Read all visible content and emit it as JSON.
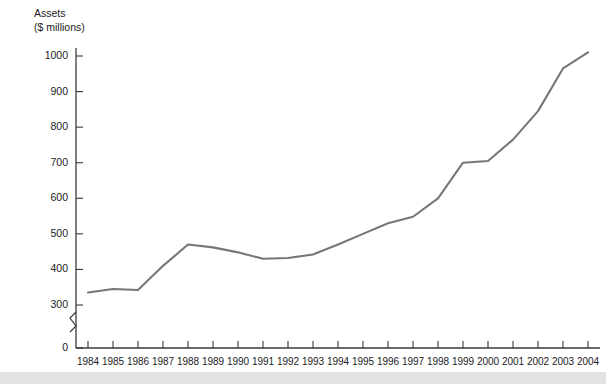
{
  "chart_data": {
    "type": "line",
    "title": "Assets",
    "subtitle": "($ millions)",
    "ylabel": "Assets ($ millions)",
    "xlabel": "",
    "grid": false,
    "legend": "none",
    "axis_break": true,
    "axis_break_between": [
      0,
      300
    ],
    "line_color": "#777777",
    "ylim": [
      0,
      1050
    ],
    "yticks": [
      0,
      300,
      400,
      500,
      600,
      700,
      800,
      900,
      1000
    ],
    "ytick_labels": [
      "0",
      "300",
      "400",
      "500",
      "600",
      "700",
      "800",
      "900",
      "1000"
    ],
    "categories": [
      "1984",
      "1985",
      "1986",
      "1987",
      "1988",
      "1989",
      "1990",
      "1991",
      "1992",
      "1993",
      "1994",
      "1995",
      "1996",
      "1997",
      "1998",
      "1999",
      "2000",
      "2001",
      "2002",
      "2003",
      "2004"
    ],
    "x": [
      1984,
      1985,
      1986,
      1987,
      1988,
      1989,
      1990,
      1991,
      1992,
      1993,
      1994,
      1995,
      1996,
      1997,
      1998,
      1999,
      2000,
      2001,
      2002,
      2003,
      2004
    ],
    "values": [
      335,
      345,
      342,
      410,
      470,
      462,
      448,
      430,
      432,
      442,
      470,
      500,
      530,
      548,
      600,
      700,
      705,
      765,
      845,
      965,
      1010
    ],
    "series": [
      {
        "name": "Assets",
        "values": [
          335,
          345,
          342,
          410,
          470,
          462,
          448,
          430,
          432,
          442,
          470,
          500,
          530,
          548,
          600,
          700,
          705,
          765,
          845,
          965,
          1010
        ]
      }
    ]
  },
  "colors": {
    "line": "#777777",
    "axis": "#3a3a3a",
    "text": "#1b1b1b",
    "footer_band": "#e2e2e2"
  }
}
